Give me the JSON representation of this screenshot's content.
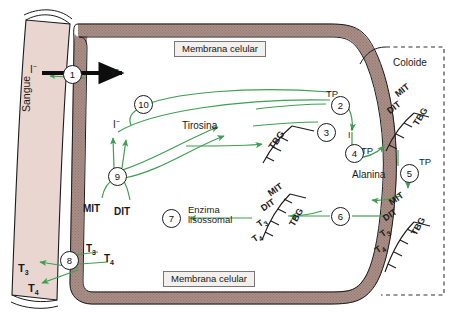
{
  "diagram": {
    "title": "Sintese dos hormonios tireoidianos",
    "colors": {
      "membrane_fill": "#a98f86",
      "blood_fill": "#e9d6d1",
      "arrow_green": "#3f9e52",
      "outline": "#1b1b1b",
      "dashed_border": "#333333",
      "label_box": "#f2efec"
    },
    "regions": {
      "blood": "Sangue",
      "colloid": "Coloide",
      "membrane_top": "Membrana celular",
      "membrane_bottom": "Membrana celular"
    },
    "steps": [
      {
        "id": "1",
        "label": "1"
      },
      {
        "id": "2",
        "label": "2"
      },
      {
        "id": "3",
        "label": "3"
      },
      {
        "id": "4",
        "label": "4"
      },
      {
        "id": "5",
        "label": "5"
      },
      {
        "id": "6",
        "label": "6"
      },
      {
        "id": "7",
        "label": "7"
      },
      {
        "id": "8",
        "label": "8"
      },
      {
        "id": "9",
        "label": "9"
      },
      {
        "id": "10",
        "label": "10"
      }
    ],
    "molecules": {
      "iodide_blood": "I",
      "iodide_cell": "I",
      "iodide_mid": "I",
      "iodine_atomic": "I",
      "tyrosine": "Tirosina",
      "alanine": "Alanina",
      "mit": "MIT",
      "dit": "DIT",
      "tbg": "TBG",
      "t3": "T",
      "t4": "T",
      "tp": "TP",
      "enzyme_line1": "Enzima",
      "enzyme_line2": "lisossomal"
    },
    "superscripts": {
      "minus": "−",
      "degree": "°",
      "three": "3",
      "four": "4"
    }
  }
}
